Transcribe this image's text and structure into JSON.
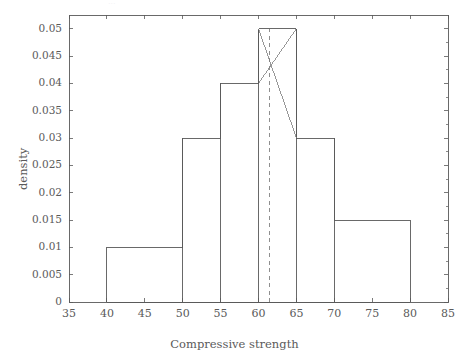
{
  "figure": {
    "background_color": "#ffffff",
    "line_color": "#595959",
    "text_color": "#5a5a5a",
    "frame": {
      "left": 69,
      "right": 448,
      "top": 15,
      "bottom": 302
    }
  },
  "chart_data": {
    "type": "bar",
    "subtype": "histogram-density",
    "title": "",
    "xlabel": "Compressive strength",
    "ylabel": "density",
    "xlim": [
      35,
      85
    ],
    "ylim": [
      0,
      0.0525
    ],
    "grid": false,
    "legend": null,
    "xticks": [
      35,
      40,
      45,
      50,
      55,
      60,
      65,
      70,
      75,
      80,
      85
    ],
    "xtick_labels": [
      "35",
      "40",
      "45",
      "50",
      "55",
      "60",
      "65",
      "70",
      "75",
      "80",
      "85"
    ],
    "yticks": [
      0,
      0.005,
      0.01,
      0.015,
      0.02,
      0.025,
      0.03,
      0.035,
      0.04,
      0.045,
      0.05
    ],
    "ytick_labels": [
      "0",
      "0.005",
      "0.01",
      "0.015",
      "0.02",
      "0.025",
      "0.03",
      "0.035",
      "0.04",
      "0.045",
      "0.05"
    ],
    "bins": [
      {
        "left": 40,
        "right": 50,
        "density": 0.01
      },
      {
        "left": 50,
        "right": 55,
        "density": 0.03
      },
      {
        "left": 55,
        "right": 60,
        "density": 0.04
      },
      {
        "left": 60,
        "right": 65,
        "density": 0.05
      },
      {
        "left": 65,
        "right": 70,
        "density": 0.03
      },
      {
        "left": 70,
        "right": 80,
        "density": 0.015
      }
    ],
    "categories": [
      "40-50",
      "50-55",
      "55-60",
      "60-65",
      "65-70",
      "70-80"
    ],
    "values": [
      0.01,
      0.03,
      0.04,
      0.05,
      0.03,
      0.015
    ],
    "annotations": [
      {
        "name": "mean-line",
        "type": "vline",
        "style": "dashed",
        "x": 61.4,
        "y0": 0,
        "y1": 0.05
      },
      {
        "name": "interpolation-line-descending",
        "type": "segment",
        "x0": 60,
        "y0": 0.05,
        "x1": 65,
        "y1": 0.03
      },
      {
        "name": "interpolation-line-ascending",
        "type": "segment",
        "x0": 60,
        "y0": 0.04,
        "x1": 65,
        "y1": 0.05
      }
    ]
  }
}
